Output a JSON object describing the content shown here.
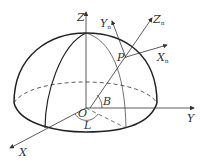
{
  "diagram": {
    "type": "hemisphere coordinate system",
    "labels": {
      "z_axis": "Z",
      "y_axis": "Y",
      "x_axis": "X",
      "origin": "O",
      "zn_axis": "Z",
      "zn_sub": "n",
      "yn_axis": "Y",
      "yn_sub": "n",
      "xn_axis": "X",
      "xn_sub": "n",
      "point": "P",
      "latitude": "B",
      "longitude": "L"
    },
    "colors": {
      "line": "#333333",
      "background": "#ffffff"
    }
  }
}
